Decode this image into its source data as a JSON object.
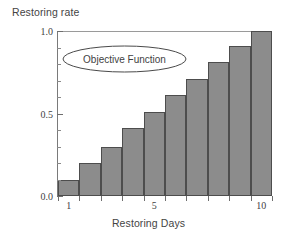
{
  "chart_data": {
    "type": "bar",
    "title": "",
    "xlabel": "Restoring Days",
    "ylabel": "Restoring rate",
    "categories": [
      "1",
      "2",
      "3",
      "4",
      "5",
      "6",
      "7",
      "8",
      "9",
      "10"
    ],
    "values": [
      0.1,
      0.2,
      0.3,
      0.41,
      0.51,
      0.61,
      0.71,
      0.81,
      0.91,
      1.0
    ],
    "ylim": [
      0.0,
      1.0
    ],
    "xlim": [
      0.5,
      10.5
    ],
    "ytick_labels": [
      "0.0",
      "0.5",
      "1.0"
    ],
    "ytick_values": [
      0.0,
      0.5,
      1.0
    ],
    "yminor_ticks": [
      0.1,
      0.2,
      0.3,
      0.4,
      0.6,
      0.7,
      0.8,
      0.9
    ],
    "xtick_labels": [
      "1",
      "5",
      "10"
    ],
    "xtick_values": [
      1,
      5,
      10
    ],
    "grid": false,
    "legend": "none",
    "bar_color": "#8c8c8c",
    "bar_edge_color": "#4d4d4d",
    "axis_color": "#7a7a7a",
    "annotations": [
      {
        "text": "Objective Function",
        "shape": "ellipse",
        "x": 2.2,
        "y": 0.84
      }
    ]
  },
  "axis": {
    "y_label": "Restoring rate",
    "x_label": "Restoring Days",
    "y_ticks": [
      {
        "label": "1.0",
        "value": 1.0
      },
      {
        "label": "0.5",
        "value": 0.5
      },
      {
        "label": "0.0",
        "value": 0.0
      }
    ],
    "x_ticks": [
      {
        "label": "1",
        "value": 1
      },
      {
        "label": "5",
        "value": 5
      },
      {
        "label": "10",
        "value": 10
      }
    ]
  },
  "annotation": {
    "label": "Objective Function"
  }
}
